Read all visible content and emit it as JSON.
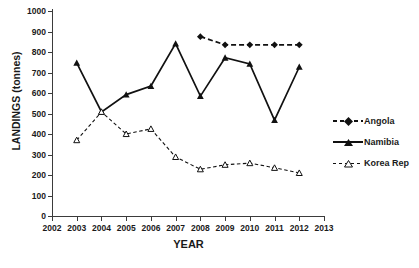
{
  "chart_data": {
    "type": "line",
    "title": "",
    "xlabel": "YEAR",
    "ylabel": "LANDINGS (tonnes)",
    "xlim": [
      2002,
      2013
    ],
    "ylim": [
      0,
      1000
    ],
    "ytick_step": 100,
    "grid": false,
    "legend_position": "right",
    "xticks": [
      "2002",
      "2003",
      "2004",
      "2005",
      "2006",
      "2007",
      "2008",
      "2009",
      "2010",
      "2011",
      "2012",
      "2013"
    ],
    "yticks": [
      "0",
      "100",
      "200",
      "300",
      "400",
      "500",
      "600",
      "700",
      "800",
      "900",
      "1000"
    ],
    "x": [
      2003,
      2004,
      2005,
      2006,
      2007,
      2008,
      2009,
      2010,
      2011,
      2012
    ],
    "series": [
      {
        "name": "Angola",
        "marker": "filled-diamond",
        "linestyle": "dashed",
        "color": "#111111",
        "x": [
          2008,
          2009,
          2010,
          2011,
          2012
        ],
        "values": [
          875,
          835,
          835,
          835,
          835
        ]
      },
      {
        "name": "Namibia",
        "marker": "filled-triangle",
        "linestyle": "solid",
        "color": "#111111",
        "x": [
          2003,
          2004,
          2005,
          2006,
          2007,
          2008,
          2009,
          2010,
          2011,
          2012
        ],
        "values": [
          747,
          508,
          592,
          634,
          841,
          585,
          772,
          742,
          468,
          727
        ]
      },
      {
        "name": "Korea Rep",
        "marker": "open-triangle",
        "linestyle": "dashed",
        "color": "#111111",
        "x": [
          2003,
          2004,
          2005,
          2006,
          2007,
          2008,
          2009,
          2010,
          2011,
          2012
        ],
        "values": [
          370,
          508,
          400,
          425,
          288,
          228,
          250,
          258,
          235,
          210
        ]
      }
    ]
  },
  "legend": {
    "items": [
      {
        "label": "Angola"
      },
      {
        "label": "Namibia"
      },
      {
        "label": "Korea Rep"
      }
    ]
  },
  "axes": {
    "x_title": "YEAR",
    "y_title": "LANDINGS (tonnes)"
  }
}
